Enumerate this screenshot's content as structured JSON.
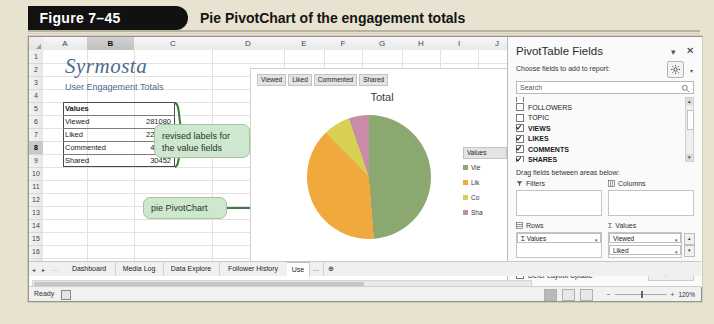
{
  "figure": {
    "number": "Figure 7–45",
    "caption": "Pie PivotChart of the engagement totals"
  },
  "spreadsheet": {
    "columns": [
      "A",
      "B",
      "C",
      "D",
      "E",
      "F",
      "G",
      "H",
      "I",
      "J",
      "K"
    ],
    "selected_column": "B",
    "rows": [
      "1",
      "2",
      "3",
      "4",
      "5",
      "6",
      "7",
      "8",
      "9",
      "10",
      "11",
      "12",
      "13",
      "14",
      "15",
      "16",
      "17"
    ],
    "selected_row": "8",
    "brand_title": "Syrmosta",
    "subtitle": "User Engagement Totals",
    "values_header": "Values",
    "data_rows": [
      {
        "label": "Viewed",
        "value": "281080"
      },
      {
        "label": "Liked",
        "value": "225129"
      },
      {
        "label": "Commented",
        "value": "40476"
      },
      {
        "label": "Shared",
        "value": "30452"
      }
    ]
  },
  "callouts": [
    {
      "text": "revised labels for the value fields"
    },
    {
      "text": "pie PivotChart"
    }
  ],
  "chart": {
    "filter_buttons": [
      "Viewed",
      "Liked",
      "Commented",
      "Shared"
    ],
    "title": "Total",
    "legend_title": "Values",
    "legend_items": [
      "Vie",
      "Lik",
      "Co",
      "Sha"
    ]
  },
  "chart_data": {
    "type": "pie",
    "title": "Total",
    "categories": [
      "Viewed",
      "Liked",
      "Commented",
      "Shared"
    ],
    "values": [
      281080,
      225129,
      40476,
      30452
    ],
    "colors": [
      "#8aa870",
      "#f0a93c",
      "#d8cf55",
      "#c98ba8"
    ],
    "legend": "right",
    "legend_title": "Values"
  },
  "panel": {
    "title": "PivotTable Fields",
    "minimize_icon": "▾",
    "close_icon": "✕",
    "choose_label": "Choose fields to add to report:",
    "gear_caret": "▾",
    "search_placeholder": "Search",
    "fields": [
      {
        "label": "FOLLOWERS",
        "checked": false
      },
      {
        "label": "TOPIC",
        "checked": false
      },
      {
        "label": "VIEWS",
        "checked": true
      },
      {
        "label": "LIKES",
        "checked": true
      },
      {
        "label": "COMMENTS",
        "checked": true
      },
      {
        "label": "SHARES",
        "checked": true
      }
    ],
    "drag_label": "Drag fields between areas below:",
    "areas": {
      "filters_label": "Filters",
      "columns_label": "Columns",
      "rows_label": "Rows",
      "values_label": "Values",
      "rows_chips": [
        "Σ Values"
      ],
      "values_chips": [
        "Viewed",
        "Liked"
      ]
    },
    "defer_label": "Defer Layout Update",
    "update_label": "Update"
  },
  "tabs": {
    "items": [
      "Dashboard",
      "Media Log",
      "Data Explore",
      "Follower History",
      "Use"
    ],
    "active": "Use",
    "overflow": "…",
    "add_label": "⊕",
    "nav": [
      "◂",
      "▸",
      "…"
    ]
  },
  "status": {
    "ready": "Ready",
    "zoom": "120%",
    "zoom_out": "−",
    "zoom_in": "+"
  }
}
